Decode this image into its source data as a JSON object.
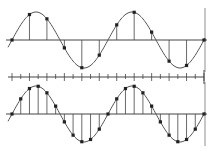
{
  "diagram": {
    "colors": {
      "line": "#444444",
      "curve": "#555555",
      "dot": "#222222",
      "background": "#ffffff"
    },
    "wave": {
      "x_start": 12,
      "x_end": 204,
      "period": 96,
      "amplitude": 28
    },
    "panels": [
      {
        "name": "top",
        "axis_y": 40,
        "sample_count": 12,
        "label": "coarse sampling"
      },
      {
        "name": "bottom",
        "axis_y": 114,
        "sample_count": 23,
        "label": "fine sampling"
      }
    ],
    "time_axis": {
      "y": 77,
      "x_start": 8,
      "x_end": 204,
      "tick_count": 23
    }
  }
}
